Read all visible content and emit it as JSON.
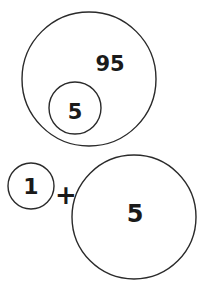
{
  "diagram": {
    "top_group": {
      "outer_circle": {
        "label": "95",
        "cx": 89,
        "cy": 79,
        "r": 67
      },
      "inner_circle": {
        "label": "5",
        "cx": 75,
        "cy": 108,
        "r": 26
      }
    },
    "bottom_group": {
      "small_circle": {
        "label": "1",
        "cx": 31,
        "cy": 186,
        "r": 23
      },
      "operator": "+",
      "large_circle": {
        "label": "5",
        "cx": 134,
        "cy": 217,
        "r": 62
      }
    },
    "colors": {
      "stroke": "#2a2a2a",
      "text": "#1a1a1a",
      "background": "#ffffff"
    }
  }
}
